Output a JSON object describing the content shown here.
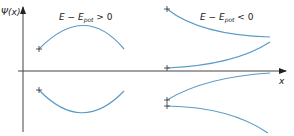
{
  "diagram": {
    "y_axis_label": "Ψ(x)",
    "x_axis_label": "x",
    "region_left_label": {
      "main": "E − E",
      "sub": "pot",
      "rel": " > 0"
    },
    "region_right_label": {
      "main": "E − E",
      "sub": "pot",
      "rel": " < 0"
    },
    "curve_color": "#5b9bc8",
    "axis_color": "#333333",
    "curves": [
      {
        "name": "oscillatory-positive",
        "region": "left",
        "shape": "concave-down arch above axis"
      },
      {
        "name": "oscillatory-negative",
        "region": "left",
        "shape": "concave-up arch below axis"
      },
      {
        "name": "decaying-upper-positive",
        "region": "right",
        "shape": "decreasing concave-up above axis"
      },
      {
        "name": "growing-lower-positive",
        "region": "right",
        "shape": "increasing from near axis above axis"
      },
      {
        "name": "growing-upper-negative",
        "region": "right",
        "shape": "rising toward axis below axis"
      },
      {
        "name": "decaying-lower-negative",
        "region": "right",
        "shape": "falling away below axis"
      }
    ],
    "markers": "+"
  }
}
